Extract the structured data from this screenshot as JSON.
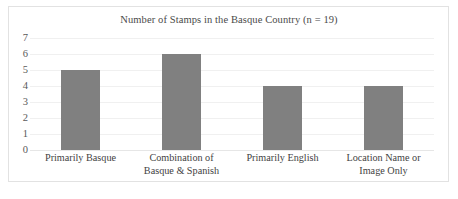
{
  "chart_data": {
    "type": "bar",
    "title": "Number of Stamps in the Basque Country (n = 19)",
    "xlabel": "",
    "ylabel": "",
    "ylim": [
      0,
      7
    ],
    "yticks": [
      "7",
      "6",
      "5",
      "4",
      "3",
      "2",
      "1",
      "0"
    ],
    "grid": true,
    "legend": null,
    "bar_color": "#808080",
    "categories": [
      "Primarily Basque",
      "Combination of Basque & Spanish",
      "Primarily English",
      "Location Name or Image Only"
    ],
    "category_lines": [
      [
        "Primarily Basque",
        ""
      ],
      [
        "Combination of",
        "Basque & Spanish"
      ],
      [
        "Primarily English",
        ""
      ],
      [
        "Location Name or",
        "Image Only"
      ]
    ],
    "values": [
      5,
      6,
      4,
      4
    ]
  }
}
